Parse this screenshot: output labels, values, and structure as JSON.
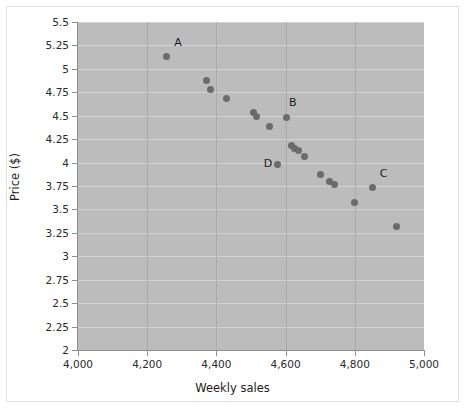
{
  "chart_data": {
    "type": "scatter",
    "title": "",
    "xlabel": "Weekly sales",
    "ylabel": "Price ($)",
    "xlim": [
      4000,
      5000
    ],
    "ylim": [
      2,
      5.5
    ],
    "grid": true,
    "legend": "none",
    "plot_background": "#bcbcbc",
    "marker_color": "#6b6b6b",
    "xticks": [
      "4,000",
      "4,200",
      "4,400",
      "4,600",
      "4,800",
      "5,000"
    ],
    "xtick_values": [
      4000,
      4200,
      4400,
      4600,
      4800,
      5000
    ],
    "yticks": [
      "2",
      "2.25",
      "2.5",
      "2.75",
      "3",
      "3.25",
      "3.5",
      "3.75",
      "4",
      "4.25",
      "4.5",
      "4.75",
      "5",
      "5.25",
      "5.5"
    ],
    "ytick_values": [
      2,
      2.25,
      2.5,
      2.75,
      3,
      3.25,
      3.5,
      3.75,
      4,
      4.25,
      4.5,
      4.75,
      5,
      5.25,
      5.5
    ],
    "points": [
      {
        "x": 4255,
        "y": 5.13,
        "label": "A"
      },
      {
        "x": 4372,
        "y": 4.88,
        "label": ""
      },
      {
        "x": 4382,
        "y": 4.78,
        "label": ""
      },
      {
        "x": 4428,
        "y": 4.68,
        "label": ""
      },
      {
        "x": 4507,
        "y": 4.53,
        "label": ""
      },
      {
        "x": 4517,
        "y": 4.49,
        "label": ""
      },
      {
        "x": 4553,
        "y": 4.38,
        "label": ""
      },
      {
        "x": 4603,
        "y": 4.48,
        "label": "B"
      },
      {
        "x": 4617,
        "y": 4.18,
        "label": ""
      },
      {
        "x": 4625,
        "y": 4.15,
        "label": ""
      },
      {
        "x": 4637,
        "y": 4.13,
        "label": ""
      },
      {
        "x": 4655,
        "y": 4.07,
        "label": ""
      },
      {
        "x": 4578,
        "y": 3.98,
        "label": "D"
      },
      {
        "x": 4700,
        "y": 3.87,
        "label": ""
      },
      {
        "x": 4727,
        "y": 3.8,
        "label": ""
      },
      {
        "x": 4740,
        "y": 3.77,
        "label": ""
      },
      {
        "x": 4800,
        "y": 3.57,
        "label": ""
      },
      {
        "x": 4850,
        "y": 3.73,
        "label": "C"
      },
      {
        "x": 4920,
        "y": 3.32,
        "label": ""
      }
    ],
    "annotations": [
      {
        "text": "A",
        "x": 4278,
        "y": 5.28
      },
      {
        "text": "B",
        "x": 4610,
        "y": 4.64
      },
      {
        "text": "C",
        "x": 4872,
        "y": 3.88
      },
      {
        "text": "D",
        "x": 4537,
        "y": 3.98
      }
    ]
  }
}
